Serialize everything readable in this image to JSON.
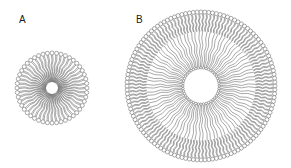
{
  "panels": [
    {
      "label": "A",
      "structure": "micelle",
      "center": [
        52,
        88
      ],
      "outer_radius": 37,
      "inner_radius": 6,
      "head_count": 48,
      "layers": 1
    },
    {
      "label": "B",
      "structure": "vesicle",
      "center": [
        201,
        86
      ],
      "outer_radius": 76,
      "inner_radius": 17,
      "head_count": 120,
      "inner_head_count": 44,
      "layers": 2
    }
  ],
  "colors": {
    "stroke": "#555555",
    "background": "#ffffff",
    "label": "#222222"
  }
}
